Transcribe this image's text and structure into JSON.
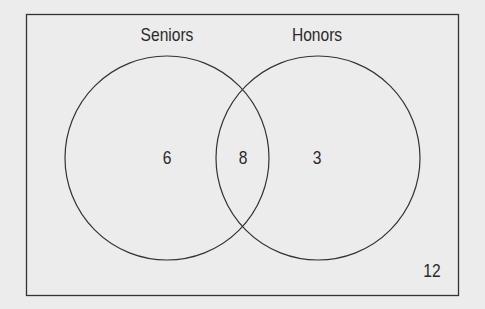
{
  "diagram": {
    "type": "venn",
    "sets": [
      {
        "label": "Seniors",
        "only_count": "6"
      },
      {
        "label": "Honors",
        "only_count": "3"
      }
    ],
    "intersection_count": "8",
    "outside_count": "12",
    "colors": {
      "background": "#ececec",
      "stroke": "#333333",
      "text": "#2a2a2a"
    }
  }
}
